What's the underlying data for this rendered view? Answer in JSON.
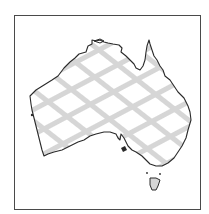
{
  "map": {
    "region": "Australia",
    "style": "crosshatch-fill",
    "colors": {
      "background": "#ffffff",
      "frame": "#4a4a4a",
      "coastline": "#2a2a2a",
      "hatch": "#d6d6d6",
      "land": "#ffffff"
    },
    "features": [
      "mainland",
      "tasmania",
      "kangaroo-island"
    ]
  }
}
